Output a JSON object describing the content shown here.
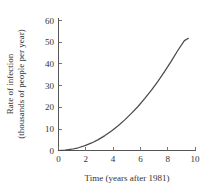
{
  "chart_data": {
    "type": "line",
    "title": "",
    "subtitle": "",
    "xlabel": "Time (years after 1981)",
    "ylabel_line1": "Rate of infection",
    "ylabel_line2": "(thousands of people per year)",
    "xlim": [
      0,
      10.3
    ],
    "ylim": [
      0,
      62
    ],
    "xticks": [
      0,
      2,
      4,
      6,
      8,
      10
    ],
    "xticklabels": [
      "0",
      "2",
      "4",
      "6",
      "8",
      "10"
    ],
    "yticks": [
      0,
      10,
      20,
      30,
      40,
      50,
      60
    ],
    "yticklabels": [
      "0",
      "10",
      "20",
      "30",
      "40",
      "50",
      "60"
    ],
    "grid": false,
    "legend": false,
    "series": [
      {
        "name": "Rate of infection",
        "color": "#4a4a4a",
        "x": [
          0,
          0.5,
          1,
          1.5,
          2,
          2.5,
          3,
          3.5,
          4,
          4.5,
          5,
          5.5,
          6,
          6.5,
          7,
          7.5,
          8,
          8.5,
          9,
          9.5,
          9.8
        ],
        "y": [
          0,
          0.15,
          0.6,
          1.3,
          2.3,
          3.6,
          5.2,
          7.1,
          9.3,
          11.8,
          14.6,
          17.7,
          21.0,
          24.7,
          28.7,
          33.0,
          37.6,
          42.5,
          47.7,
          52.4,
          53.5
        ]
      }
    ],
    "annotations": []
  },
  "figure": {
    "caption": "",
    "background_color": "#ffffff",
    "axis_color": "#555555"
  }
}
